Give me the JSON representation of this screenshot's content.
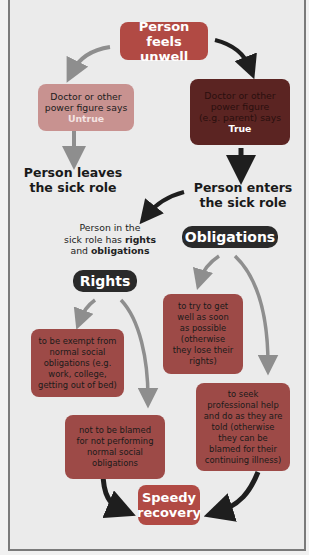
{
  "diagram": {
    "colors": {
      "primary_red": "#b14a44",
      "untrue_box": "#c89290",
      "true_box": "#5b2422",
      "rights_obligation_box": "#9d4a47",
      "pill": "#2a2a2a",
      "arrow_dark": "#1e1e1e",
      "arrow_gray": "#8e8e8e",
      "background": "#ebebeb"
    },
    "nodes": {
      "start": {
        "line1": "Person feels",
        "line2": "unwell"
      },
      "untrue": {
        "line1": "Doctor or other",
        "line2": "power figure says",
        "verdict": "Untrue"
      },
      "true": {
        "line1": "Doctor or other",
        "line2": "power figure",
        "line3": "(e.g. parent) says",
        "verdict": "True"
      },
      "leaves": {
        "line1": "Person leaves",
        "line2": "the sick role"
      },
      "enters": {
        "line1": "Person enters",
        "line2": "the sick role"
      },
      "has_rights": {
        "line1": "Person in the",
        "line2_prefix": "sick role has ",
        "line2_bold": "rights",
        "line3_prefix": "and ",
        "line3_bold": "obligations"
      },
      "obligations": {
        "label": "Obligations"
      },
      "rights": {
        "label": "Rights"
      },
      "right_1": {
        "lines": [
          "to be exempt from",
          "normal social",
          "obligations (e.g.",
          "work, college,",
          "getting out of bed)"
        ]
      },
      "right_2": {
        "lines": [
          "not to be blamed",
          "for not performing",
          "normal social",
          "obligations"
        ]
      },
      "obligation_1": {
        "lines": [
          "to try to get",
          "well as soon",
          "as possible",
          "(otherwise",
          "they lose their",
          "rights)"
        ]
      },
      "obligation_2": {
        "lines": [
          "to seek",
          "professional help",
          "and do as they are",
          "told (otherwise",
          "they can be",
          "blamed for their",
          "continuing illness)"
        ]
      },
      "end": {
        "line1": "Speedy",
        "line2": "recovery"
      }
    }
  }
}
